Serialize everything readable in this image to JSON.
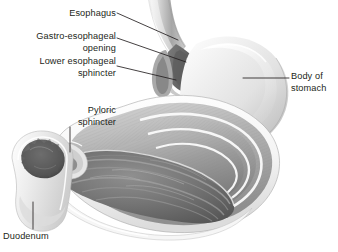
{
  "figure": {
    "background_color": "#ffffff",
    "ink_color": "#231f20",
    "labels": {
      "esophagus": "Esophagus",
      "ge_opening": "Gastro-esophageal\nopening",
      "lower_esophageal_sphincter": "Lower esophageal\nsphincter",
      "pyloric_sphincter": "Pyloric\nsphincter",
      "duodenum": "Duodenum",
      "body_of_stomach": "Body of\nstomach"
    },
    "structures": {
      "fundus": "fundus-dome",
      "body": "stomach-body",
      "muscle_layers": "muscularis-layers",
      "rugae": "gastric-rugae",
      "lumen": "stomach-lumen",
      "pylorus": "pyloric-canal",
      "duodenal_bulb": "duodenal-bulb",
      "esophagus_tube": "esophagus-tube"
    },
    "palette": {
      "outline": "#6e6e6e",
      "serosa_light": "#f2f2f2",
      "muscle_mid": "#b9b9b9",
      "muscle_dark": "#8c8c8c",
      "lumen_dark": "#6b6b6b",
      "lumen_deep": "#4a4a4a",
      "rugae_highlight": "#c9c9c9",
      "fundus_light": "#ededed",
      "fundus_shadow": "#bdbdbd"
    }
  }
}
